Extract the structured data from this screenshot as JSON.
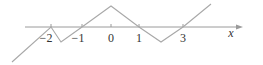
{
  "diagram": {
    "type": "piecewise-linear function graph",
    "axis": {
      "label": "x",
      "color": "#9a9a9a",
      "ticks": [
        {
          "label": "−2",
          "value": -2
        },
        {
          "label": "−1",
          "value": -1
        },
        {
          "label": "0",
          "value": 0
        },
        {
          "label": "1",
          "value": 1
        },
        {
          "label": "3",
          "value": 3
        }
      ]
    },
    "curve": {
      "color": "#a8a8a8",
      "description": "Zigzag polyline crossing the x-axis at -2, -1, 1 and 3, local min between -2 and -1, peak at 0, local min between 1 and 3"
    }
  }
}
